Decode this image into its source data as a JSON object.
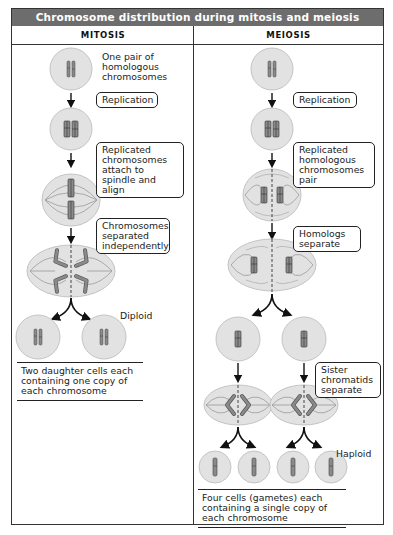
{
  "title": "Chromosome distribution during mitosis and meiosis",
  "columns": {
    "mitosis": {
      "header": "MITOSIS",
      "intro_label": "One pair of homologous chromosomes",
      "steps": [
        "Replication",
        "Replicated chromosomes attach to spindle and align",
        "Chromosomes separated independently"
      ],
      "ploidy_label": "Diploid",
      "result": "Two daughter cells each containing one copy of each chromosome"
    },
    "meiosis": {
      "header": "MEIOSIS",
      "steps": [
        "Replication",
        "Replicated homologous chromosomes pair",
        "Homologs separate",
        "Sister chromatids separate"
      ],
      "ploidy_label": "Haploid",
      "result": "Four cells (gametes) each containing a single copy of each chromosome"
    }
  },
  "colors": {
    "title_bar": "#6d6d6d",
    "cell_fill": "#e2e2e2",
    "cell_stroke": "#bdbdbd",
    "chromosome": "#8a8a8a",
    "line": "#222222"
  }
}
